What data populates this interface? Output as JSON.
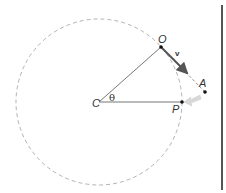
{
  "diagram": {
    "points": {
      "C": {
        "label": "C",
        "x": 99,
        "y": 102
      },
      "O": {
        "label": "O",
        "x": 161,
        "y": 47
      },
      "A": {
        "label": "A",
        "x": 205,
        "y": 92
      },
      "P": {
        "label": "P",
        "x": 182,
        "y": 102
      }
    },
    "angle_label": "θ",
    "velocity_label": "v",
    "circle": {
      "center": "C",
      "radius": 83,
      "style": "dashed"
    },
    "colors": {
      "circle": "#9a9a9a",
      "lines": "#666666",
      "velocity_arrow": "#555555",
      "force_arrow": "#d8d8d8",
      "wall": "#555555"
    }
  }
}
